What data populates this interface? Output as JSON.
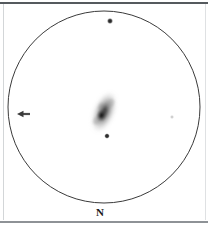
{
  "chart_data": {
    "type": "scatter",
    "title": "",
    "subtitle": "",
    "xlabel": "",
    "ylabel": "",
    "grid": false,
    "legend": null,
    "field": {
      "shape": "circle",
      "center_px": [
        104,
        107
      ],
      "radius_px": 96,
      "outline_color": "#3a3a3a",
      "background_color": "#ffffff"
    },
    "orientation": {
      "label": "N",
      "label_position": "bottom",
      "label_px": [
        100,
        212
      ]
    },
    "objects": [
      {
        "name": "galaxy",
        "type": "extended",
        "x_px": 104,
        "y_px": 112,
        "semi_major_px": 22,
        "semi_minor_px": 11,
        "position_angle_deg": 22,
        "core_x_px": 103,
        "core_y_px": 116,
        "peak_darkness": 0.88,
        "color": "#2b2b2b"
      },
      {
        "name": "star-north",
        "type": "point",
        "x_px": 110,
        "y_px": 21,
        "radius_px": 2.0,
        "color": "#2a2a2a"
      },
      {
        "name": "star-south",
        "type": "point",
        "x_px": 107,
        "y_px": 136,
        "radius_px": 1.8,
        "color": "#2a2a2a"
      },
      {
        "name": "star-east-faint",
        "type": "point",
        "x_px": 172,
        "y_px": 117,
        "radius_px": 1.2,
        "color": "#b9b9b9"
      },
      {
        "name": "marker-arrow",
        "type": "arrow",
        "x_px": 24,
        "y_px": 114,
        "length_px": 12,
        "direction": "left",
        "color": "#3a3a3a"
      }
    ],
    "values": [
      21,
      136,
      117,
      114
    ],
    "categories": [
      "star-north",
      "star-south",
      "star-east-faint",
      "marker-arrow"
    ]
  },
  "frame": {
    "top_color": "#555a5e",
    "bottom_color": "#8e9296",
    "side_color": "#d9dcde"
  },
  "compass": {
    "north_label": "N"
  }
}
